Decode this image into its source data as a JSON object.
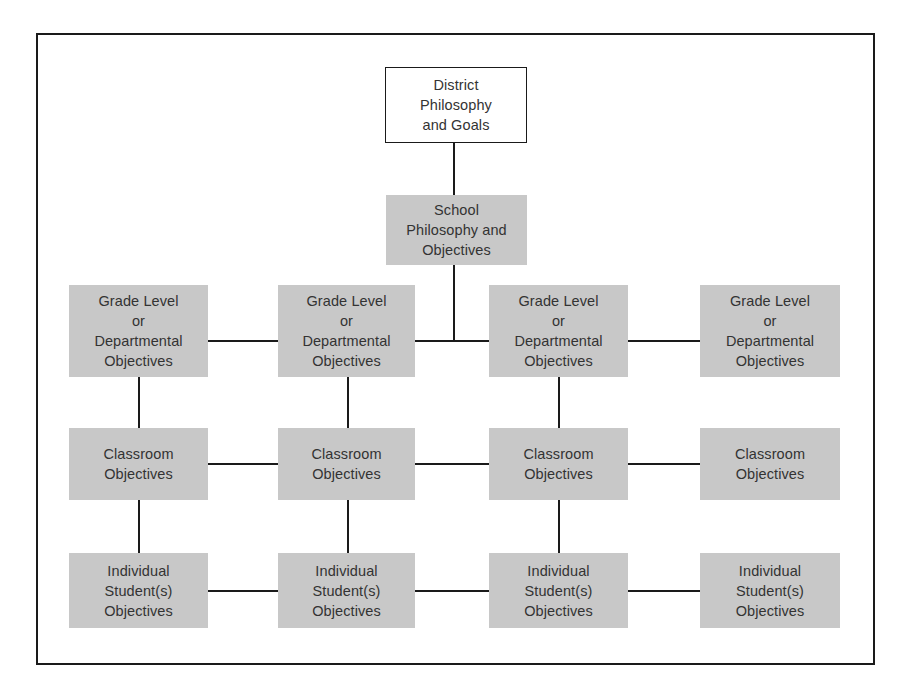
{
  "diagram": {
    "type": "hierarchy",
    "caption_fragment": "Figure 1.1 Organization of educational goals and objectives",
    "colors": {
      "shaded_fill": "#c8c8c8",
      "line": "#1a1a1a",
      "text": "#333333",
      "background": "#ffffff"
    },
    "top": {
      "district": {
        "lines": [
          "District",
          "Philosophy",
          "and Goals"
        ],
        "style": "outlined"
      },
      "school": {
        "lines": [
          "School",
          "Philosophy and",
          "Objectives"
        ],
        "style": "shaded"
      }
    },
    "rows": [
      {
        "level": "grade-level",
        "nodes": [
          {
            "lines": [
              "Grade Level",
              "or",
              "Departmental",
              "Objectives"
            ]
          },
          {
            "lines": [
              "Grade Level",
              "or",
              "Departmental",
              "Objectives"
            ]
          },
          {
            "lines": [
              "Grade Level",
              "or",
              "Departmental",
              "Objectives"
            ]
          },
          {
            "lines": [
              "Grade Level",
              "or",
              "Departmental",
              "Objectives"
            ]
          }
        ]
      },
      {
        "level": "classroom",
        "nodes": [
          {
            "lines": [
              "Classroom",
              "Objectives"
            ]
          },
          {
            "lines": [
              "Classroom",
              "Objectives"
            ]
          },
          {
            "lines": [
              "Classroom",
              "Objectives"
            ]
          },
          {
            "lines": [
              "Classroom",
              "Objectives"
            ]
          }
        ]
      },
      {
        "level": "individual-student",
        "nodes": [
          {
            "lines": [
              "Individual",
              "Student(s)",
              "Objectives"
            ]
          },
          {
            "lines": [
              "Individual",
              "Student(s)",
              "Objectives"
            ]
          },
          {
            "lines": [
              "Individual",
              "Student(s)",
              "Objectives"
            ]
          },
          {
            "lines": [
              "Individual",
              "Student(s)",
              "Objectives"
            ]
          }
        ]
      }
    ],
    "edges": [
      [
        "District Philosophy and Goals",
        "School Philosophy and Objectives"
      ],
      [
        "School Philosophy and Objectives",
        "Grade Level row (junction between columns 2 and 3)"
      ],
      [
        "Grade Level 1",
        "Grade Level 2"
      ],
      [
        "Grade Level 2",
        "Grade Level 3"
      ],
      [
        "Grade Level 3",
        "Grade Level 4"
      ],
      [
        "Classroom 1",
        "Classroom 2"
      ],
      [
        "Classroom 2",
        "Classroom 3"
      ],
      [
        "Classroom 3",
        "Classroom 4"
      ],
      [
        "Individual 1",
        "Individual 2"
      ],
      [
        "Individual 2",
        "Individual 3"
      ],
      [
        "Individual 3",
        "Individual 4"
      ],
      [
        "Grade Level 1",
        "Classroom 1"
      ],
      [
        "Grade Level 2",
        "Classroom 2"
      ],
      [
        "Grade Level 3",
        "Classroom 3"
      ],
      [
        "Classroom 1",
        "Individual 1"
      ],
      [
        "Classroom 2",
        "Individual 2"
      ],
      [
        "Classroom 3",
        "Individual 3"
      ]
    ]
  }
}
